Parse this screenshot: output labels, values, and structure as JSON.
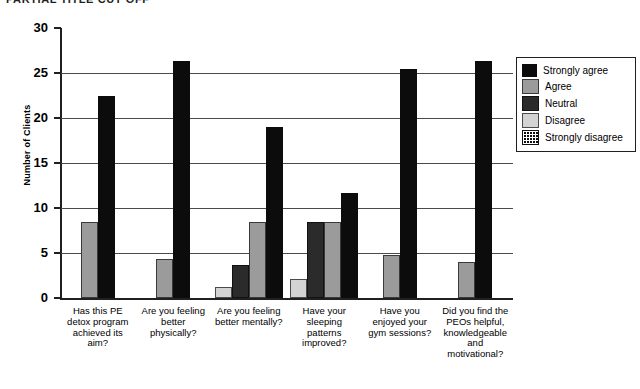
{
  "title_partial": "PARTIAL TITLE CUT OFF",
  "chart_data": {
    "type": "bar",
    "title": "",
    "xlabel": "",
    "ylabel": "Number of Clients",
    "ylim": [
      0,
      30
    ],
    "yticks": [
      0,
      5,
      10,
      15,
      20,
      25,
      30
    ],
    "grid": true,
    "legend_position": "right",
    "categories": [
      "Has this PE detox program achieved its aim?",
      "Are you feeling better physically?",
      "Are you feeling better mentally?",
      "Have your sleeping patterns improved?",
      "Have you enjoyed your gym sessions?",
      "Did you find the PEOs helpful, knowledgeable and motivational?"
    ],
    "series": [
      {
        "name": "Strongly disagree",
        "key": "strongly-disagree",
        "values": [
          0,
          0,
          0,
          0,
          0,
          0
        ]
      },
      {
        "name": "Disagree",
        "key": "disagree",
        "values": [
          0,
          0,
          1.2,
          2.1,
          0,
          0
        ]
      },
      {
        "name": "Neutral",
        "key": "neutral",
        "values": [
          0,
          0,
          3.7,
          8.5,
          0,
          0
        ]
      },
      {
        "name": "Agree",
        "key": "agree",
        "values": [
          8.5,
          4.3,
          8.5,
          8.5,
          4.8,
          4.0
        ]
      },
      {
        "name": "Strongly agree",
        "key": "strongly-agree",
        "values": [
          22.5,
          26.3,
          19.0,
          11.7,
          25.4,
          26.3
        ]
      }
    ]
  },
  "legend": {
    "items": [
      {
        "label": "Strongly agree",
        "key": "strongly-agree"
      },
      {
        "label": "Agree",
        "key": "agree"
      },
      {
        "label": "Neutral",
        "key": "neutral"
      },
      {
        "label": "Disagree",
        "key": "disagree"
      },
      {
        "label": "Strongly disagree",
        "key": "strongly-disagree"
      }
    ]
  },
  "colors": {
    "strongly_agree": "#0d0c0c",
    "agree": "#9b9b9b",
    "neutral": "#2b2b2b",
    "disagree": "#d3d3d3",
    "strongly_disagree": "#0d0c0c",
    "axis": "#231f20",
    "grid": "#4d4a4b"
  }
}
